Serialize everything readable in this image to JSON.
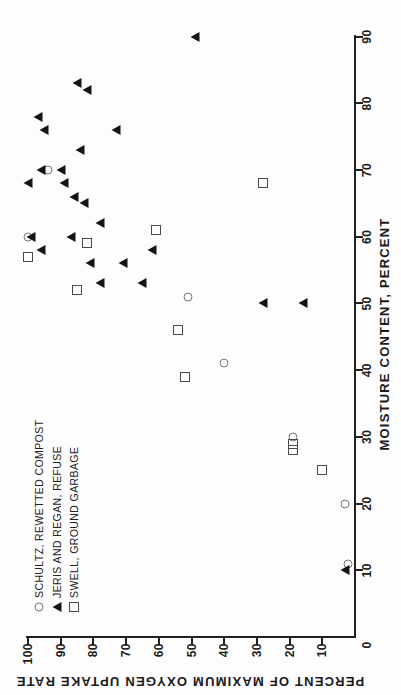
{
  "chart_data": {
    "type": "scatter",
    "title": "",
    "xlabel": "MOISTURE CONTENT, PERCENT",
    "ylabel": "PERCENT OF MAXIMUM OXYGEN UPTAKE RATE",
    "xlim": [
      0,
      90
    ],
    "ylim": [
      0,
      100
    ],
    "x_ticks": [
      0,
      10,
      20,
      30,
      40,
      50,
      60,
      70,
      80,
      90
    ],
    "y_ticks": [
      10,
      20,
      30,
      40,
      50,
      60,
      70,
      80,
      90,
      100
    ],
    "grid": false,
    "legend_position": "top-left",
    "page_orientation": "chart rotated 90 degrees counter-clockwise on portrait page",
    "series": [
      {
        "name": "SCHULTZ, REWETTED COMPOST",
        "marker": "open-circle",
        "color": "#777777",
        "points": [
          [
            70,
            94
          ],
          [
            60,
            100
          ],
          [
            51,
            51
          ],
          [
            41,
            40
          ],
          [
            30,
            19
          ],
          [
            20,
            3
          ],
          [
            11,
            2
          ]
        ]
      },
      {
        "name": "JERIS AND REGAN, REFUSE",
        "marker": "filled-triangle",
        "color": "#141414",
        "points": [
          [
            90,
            49
          ],
          [
            83,
            85
          ],
          [
            82,
            82
          ],
          [
            78,
            97
          ],
          [
            76,
            95
          ],
          [
            76,
            73
          ],
          [
            73,
            84
          ],
          [
            70,
            96
          ],
          [
            70,
            90
          ],
          [
            68,
            100
          ],
          [
            68,
            89
          ],
          [
            66,
            86
          ],
          [
            65,
            83
          ],
          [
            62,
            78
          ],
          [
            60,
            99
          ],
          [
            60,
            87
          ],
          [
            58,
            96
          ],
          [
            58,
            62
          ],
          [
            56,
            81
          ],
          [
            56,
            71
          ],
          [
            53,
            78
          ],
          [
            53,
            65
          ],
          [
            50,
            28
          ],
          [
            50,
            16
          ],
          [
            10,
            3
          ]
        ]
      },
      {
        "name": "SWELL, GROUND GARBAGE",
        "marker": "open-square",
        "color": "#4a4a4a",
        "points": [
          [
            68,
            28
          ],
          [
            61,
            61
          ],
          [
            59,
            82
          ],
          [
            57,
            100
          ],
          [
            52,
            85
          ],
          [
            46,
            54
          ],
          [
            39,
            52
          ],
          [
            29,
            19
          ],
          [
            28,
            19
          ],
          [
            25,
            10
          ]
        ]
      }
    ]
  }
}
